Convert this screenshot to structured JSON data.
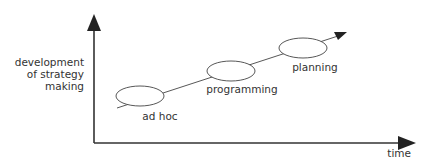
{
  "diagram": {
    "y_axis_label": [
      "development",
      "of strategy",
      "making"
    ],
    "x_axis_label": "time",
    "stages": [
      {
        "label": "ad hoc"
      },
      {
        "label": "programming"
      },
      {
        "label": "planning"
      }
    ],
    "colors": {
      "line": "#333333",
      "text": "#333333",
      "background": "#ffffff"
    }
  }
}
